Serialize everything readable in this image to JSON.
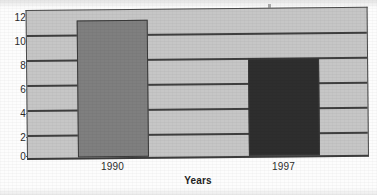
{
  "chart_data": {
    "type": "bar",
    "title": "",
    "subtitle": "",
    "categories": [
      "1990",
      "1997"
    ],
    "values": [
      11.0,
      7.8
    ],
    "series": [
      {
        "name": "",
        "values": [
          11.0,
          7.8
        ],
        "colors": [
          "#7f7f7f",
          "#2e2e2e"
        ]
      }
    ],
    "xlabel": "Years",
    "ylabel": "",
    "ylim": [
      0,
      12
    ],
    "yticks": [
      0,
      2,
      4,
      6,
      8,
      10,
      12
    ],
    "ytick_labels": [
      "0",
      "2",
      "4",
      "6",
      "8",
      "10",
      "12"
    ],
    "grid": true,
    "grid_axis": "y",
    "legend": false,
    "legend_position": "none",
    "plot_background_color": "#c6c6c6",
    "gridline_color": "#3f3f3f",
    "axis_color": "#4a4a4a",
    "annotations": []
  },
  "axes": {
    "y": {
      "ticks": [
        {
          "label": "12",
          "value": 12
        },
        {
          "label": "10",
          "value": 10
        },
        {
          "label": "8",
          "value": 8
        },
        {
          "label": "6",
          "value": 6
        },
        {
          "label": "4",
          "value": 4
        },
        {
          "label": "2",
          "value": 2
        },
        {
          "label": "0",
          "value": 0
        }
      ]
    },
    "x": {
      "title": "Years",
      "ticks": [
        {
          "label": "1990"
        },
        {
          "label": "1997"
        }
      ]
    }
  },
  "artifacts": {
    "speck_present": true
  }
}
